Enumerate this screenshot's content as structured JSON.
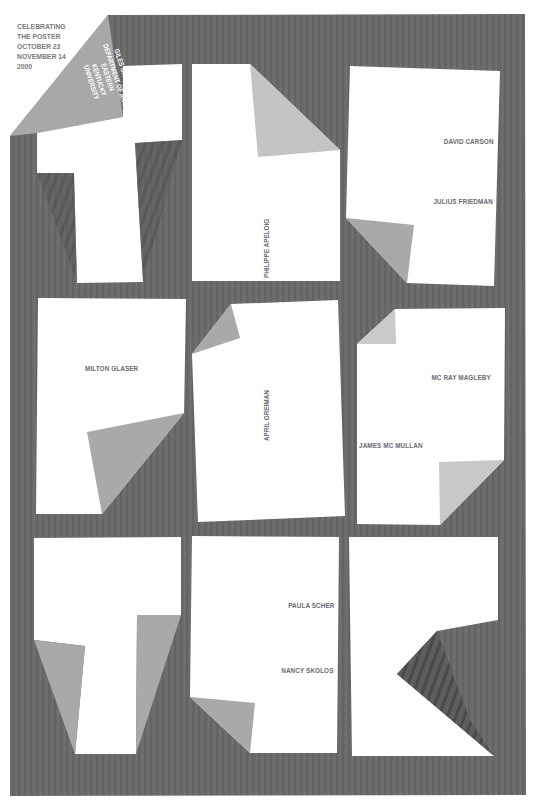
{
  "poster": {
    "colors": {
      "background": "#6b6b6b",
      "paper": "#ffffff",
      "fold": "#a9a9a9",
      "fold_light": "#c8c8c8",
      "text": "#6a6a72"
    },
    "header": {
      "line1": "CELEBRATING",
      "line2": "THE POSTER",
      "line3": "OCTOBER 23",
      "line4": "NOVEMBER 14",
      "line5": "2000"
    },
    "venue": {
      "line1": "GILES GALLERY",
      "line2": "DEPARTMENT OF ART",
      "line3": "EASTERN",
      "line4": "KENTUCKY",
      "line5": "UNIVERSITY"
    },
    "letters": [
      "t",
      "h",
      "e",
      "p",
      "o",
      "s",
      "t",
      "e",
      "r"
    ],
    "designers": {
      "philippe_apeloig": "PHILIPPE APELOIG",
      "david_carson": "DAVID CARSON",
      "julius_friedman": "JULIUS FRIEDMAN",
      "milton_glaser": "MILTON GLASER",
      "april_greiman": "APRIL GREIMAN",
      "mc_ray_magleby": "MC RAY MAGLEBY",
      "james_mc_mullan": "JAMES MC MULLAN",
      "paula_scher": "PAULA SCHER",
      "nancy_skolos": "NANCY SKOLOS"
    }
  }
}
